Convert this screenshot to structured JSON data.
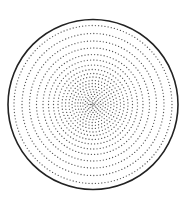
{
  "diagram": {
    "type": "concentric-dotted-rings",
    "canvas": {
      "width": 192,
      "height": 205,
      "background": "#ffffff"
    },
    "outer_circle": {
      "cx": 93,
      "cy": 104.5,
      "r": 85,
      "stroke": "#222222",
      "stroke_width": 1.6
    },
    "dots": {
      "color": "#555555",
      "radius": 0.65,
      "spacing": 3.2
    },
    "rings": [
      {
        "r": 79
      },
      {
        "r": 71
      },
      {
        "r": 63.5
      },
      {
        "r": 56.5
      },
      {
        "r": 50
      },
      {
        "r": 44.5
      },
      {
        "r": 39.5
      },
      {
        "r": 35
      },
      {
        "r": 31
      },
      {
        "r": 27.5
      },
      {
        "r": 24
      },
      {
        "r": 21
      },
      {
        "r": 18
      },
      {
        "r": 15.2
      },
      {
        "r": 12.6
      },
      {
        "r": 10.2
      },
      {
        "r": 8
      },
      {
        "r": 6
      },
      {
        "r": 4.2
      },
      {
        "r": 2.6
      },
      {
        "r": 1.2
      }
    ]
  }
}
